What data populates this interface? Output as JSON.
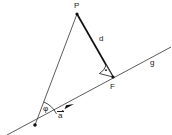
{
  "figure": {
    "type": "geometry-diagram",
    "background_color": "#ffffff",
    "stroke_color": "#1a1a1a",
    "thin_stroke_color": "#555555",
    "width": 172,
    "height": 135
  },
  "labels": {
    "point_p": "P",
    "point_f": "F",
    "distance_d": "d",
    "line_g": "g",
    "vector_a": "a",
    "angle_phi": "φ"
  },
  "geometry": {
    "point_p": {
      "x": 77,
      "y": 14
    },
    "point_f": {
      "x": 113,
      "y": 77
    },
    "origin_vertex": {
      "x": 35,
      "y": 125
    },
    "line_g_start": {
      "x": 7,
      "y": 135
    },
    "line_g_end": {
      "x": 171,
      "y": 47
    },
    "segment_pf": {
      "x1": 77,
      "y1": 14,
      "x2": 113,
      "y2": 77
    },
    "segment_p_origin": {
      "x1": 77,
      "y1": 14,
      "x2": 35,
      "y2": 125
    },
    "direction_arrow_tip": {
      "x": 72,
      "y": 106
    },
    "right_angle_marker": {
      "x": 113,
      "y": 77,
      "radius": 12
    },
    "angle_phi_arc": {
      "x": 35,
      "y": 125,
      "radius": 22
    }
  },
  "label_positions": {
    "point_p": {
      "x": 74,
      "y": 2
    },
    "point_f": {
      "x": 110,
      "y": 83
    },
    "distance_d": {
      "x": 99,
      "y": 36
    },
    "line_g": {
      "x": 150,
      "y": 60
    },
    "vector_a": {
      "x": 58,
      "y": 112
    },
    "angle_phi": {
      "x": 43,
      "y": 106
    }
  }
}
